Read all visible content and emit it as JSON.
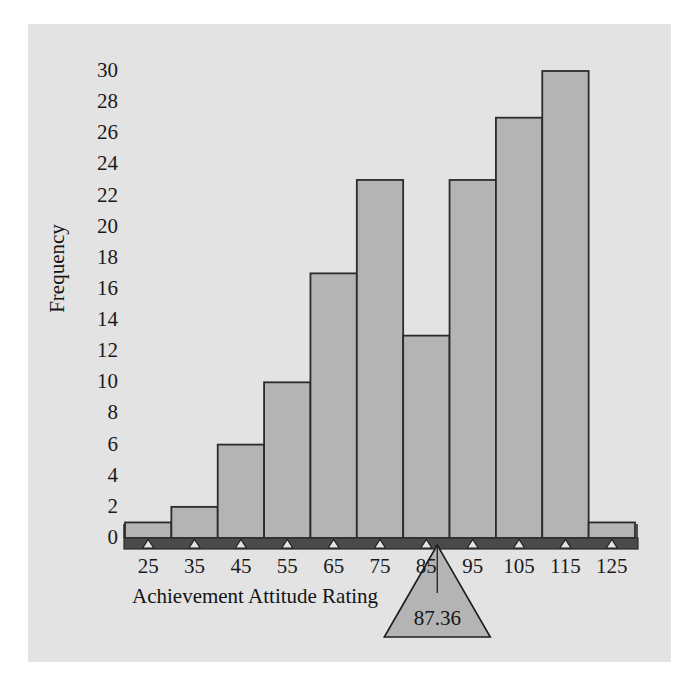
{
  "figure": {
    "background_color": "#ffffff",
    "panel_color": "#e3e3e3",
    "bar_fill_color": "#b4b4b4",
    "bar_edge_color": "#2b2b2b",
    "axis_bar_color": "#4a4a4a",
    "text_color": "#141414"
  },
  "axes": {
    "y_title": "Frequency",
    "x_title": "Achievement Attitude Rating"
  },
  "annotation": {
    "mean_label": "87.36",
    "mean_value": 87.36,
    "marker_name": "balance-point-triangle"
  },
  "chart_data": {
    "type": "bar",
    "title": "",
    "subtitle": "",
    "xlabel": "Achievement Attitude Rating",
    "ylabel": "Frequency",
    "categories": [
      "25",
      "35",
      "45",
      "55",
      "65",
      "75",
      "85",
      "95",
      "105",
      "115",
      "125"
    ],
    "bin_centers": [
      25,
      35,
      45,
      55,
      65,
      75,
      85,
      95,
      105,
      115,
      125
    ],
    "bin_edges": [
      20,
      30,
      40,
      50,
      60,
      70,
      80,
      90,
      100,
      110,
      120,
      130
    ],
    "bin_width": 10,
    "values": [
      1,
      2,
      6,
      10,
      17,
      23,
      13,
      23,
      27,
      30,
      1
    ],
    "xlim": [
      20,
      130
    ],
    "ylim": [
      0,
      30
    ],
    "y_ticks": [
      0,
      2,
      4,
      6,
      8,
      10,
      12,
      14,
      16,
      18,
      20,
      22,
      24,
      26,
      28,
      30
    ],
    "y_tick_labels": [
      "0",
      "2",
      "4",
      "6",
      "8",
      "10",
      "12",
      "14",
      "16",
      "18",
      "20",
      "22",
      "24",
      "26",
      "28",
      "30"
    ],
    "x_ticks": [
      25,
      35,
      45,
      55,
      65,
      75,
      85,
      95,
      105,
      115,
      125
    ],
    "x_tick_labels": [
      "25",
      "35",
      "45",
      "55",
      "65",
      "75",
      "85",
      "95",
      "105",
      "115",
      "125"
    ],
    "grid": false,
    "legend": null,
    "annotations": [
      {
        "type": "fulcrum-triangle",
        "label": "87.36",
        "x": 87.36,
        "note": "balance point / mean marker below x-axis"
      }
    ]
  }
}
